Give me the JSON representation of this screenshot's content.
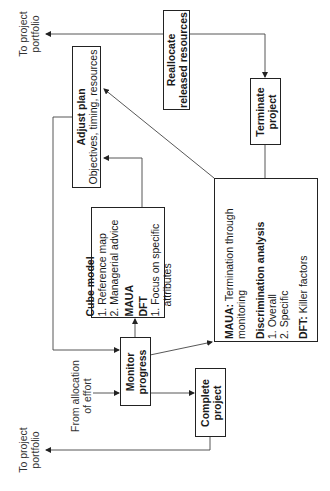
{
  "boxes": {
    "adjust_plan": {
      "title": "Adjust plan",
      "subtitle": "Objectives, timing, resources"
    },
    "reallocate": {
      "line1": "Reallocate",
      "line2": "released resources"
    },
    "terminate": {
      "line1": "Terminate",
      "line2": "project"
    },
    "cube_model": {
      "title": "Cube model",
      "items": [
        "1. Reference map",
        "2. Managerial advice"
      ],
      "maua": "MAUA",
      "dft": "DFT",
      "dft_item_line1": "1. Focus on specific",
      "dft_item_line2": "attributes"
    },
    "termination": {
      "maua_label": "MAUA:",
      "maua_text_line1": " Termination through",
      "maua_text_line2": "monitoring",
      "discrimination_title": "Discrimination analysis",
      "discrimination_items": [
        "1. Overall",
        "2. Specific"
      ],
      "dft_label": "DFT:",
      "dft_text": " Killer factors"
    },
    "monitor": {
      "line1": "Monitor",
      "line2": "progress"
    },
    "complete": {
      "line1": "Complete",
      "line2": "project"
    }
  },
  "labels": {
    "portfolio_top": {
      "line1": "To project",
      "line2": "portfolio"
    },
    "portfolio_bottom": {
      "line1": "To project",
      "line2": "portfolio"
    },
    "from_allocation": {
      "line1": "From allocation",
      "line2": "of effort"
    }
  },
  "colors": {
    "line": "#333333",
    "border": "#222222",
    "text": "#1a1a1a"
  }
}
